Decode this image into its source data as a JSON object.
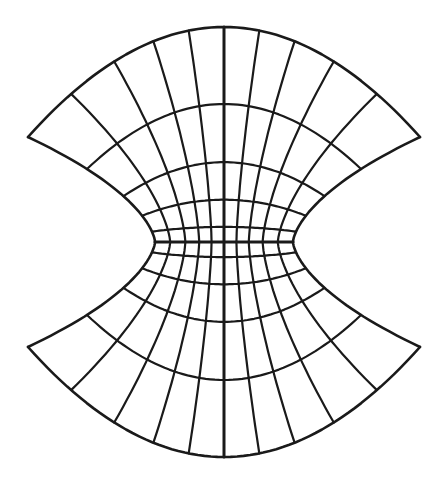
{
  "diagram": {
    "type": "curvilinear-mesh",
    "stroke_color": "#1a1a1a",
    "background_color": "#ffffff",
    "center": {
      "x": 224,
      "y": 242
    },
    "outer_boundary": {
      "top_arc": {
        "left_tip": [
          27,
          137
        ],
        "apex": [
          224,
          27
        ],
        "right_tip": [
          420,
          132
        ]
      },
      "bottom_arc": {
        "left_tip": [
          27,
          353
        ],
        "apex": [
          224,
          457
        ],
        "right_tip": [
          420,
          347
        ]
      },
      "waist_half_width": 69
    },
    "radial_lines_per_side": 4,
    "horizontal_curves_per_half": 4,
    "center_axes": [
      "vertical",
      "horizontal"
    ]
  }
}
